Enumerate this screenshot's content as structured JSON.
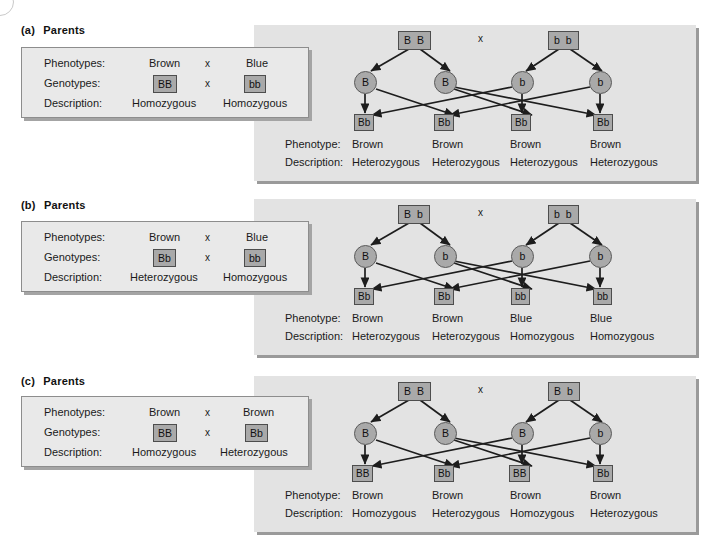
{
  "figure": {
    "colors": {
      "page_background": "#ffffff",
      "panel_background": "#e3e3e3",
      "parents_box_background": "#e9e9e9",
      "chip_fill": "#a9a9a9",
      "chip_border": "#4d4d4d",
      "shadow": "#9a9a9a",
      "text": "#1a1a1a"
    }
  },
  "labels": {
    "phenotypes_row": "Phenotypes:",
    "genotypes_row": "Genotypes:",
    "description_row": "Description:",
    "phenotype_row": "Phenotype:",
    "parents_heading": "Parents",
    "cross_symbol": "x"
  },
  "panels": [
    {
      "id": "a",
      "letter": "(a)",
      "heading": "Parents",
      "parents": {
        "phenotypes": [
          "Brown",
          "Blue"
        ],
        "genotypes": [
          "BB",
          "bb"
        ],
        "descriptions": [
          "Homozygous",
          "Homozygous"
        ],
        "cross_symbol": "x"
      },
      "diagram": {
        "parent_boxes": [
          "B B",
          "b b"
        ],
        "cross_symbol": "x",
        "gametes": [
          "B",
          "B",
          "b",
          "b"
        ],
        "offspring": [
          "Bb",
          "Bb",
          "Bb",
          "Bb"
        ],
        "phenotypes": [
          "Brown",
          "Brown",
          "Brown",
          "Brown"
        ],
        "descriptions": [
          "Heterozygous",
          "Heterozygous",
          "Heterozygous",
          "Heterozygous"
        ]
      }
    },
    {
      "id": "b",
      "letter": "(b)",
      "heading": "Parents",
      "parents": {
        "phenotypes": [
          "Brown",
          "Blue"
        ],
        "genotypes": [
          "Bb",
          "bb"
        ],
        "descriptions": [
          "Heterozygous",
          "Homozygous"
        ],
        "cross_symbol": "x"
      },
      "diagram": {
        "parent_boxes": [
          "B b",
          "b b"
        ],
        "cross_symbol": "x",
        "gametes": [
          "B",
          "b",
          "b",
          "b"
        ],
        "offspring": [
          "Bb",
          "Bb",
          "bb",
          "bb"
        ],
        "phenotypes": [
          "Brown",
          "Brown",
          "Blue",
          "Blue"
        ],
        "descriptions": [
          "Heterozygous",
          "Heterozygous",
          "Homozygous",
          "Homozygous"
        ]
      }
    },
    {
      "id": "c",
      "letter": "(c)",
      "heading": "Parents",
      "parents": {
        "phenotypes": [
          "Brown",
          "Brown"
        ],
        "genotypes": [
          "BB",
          "Bb"
        ],
        "descriptions": [
          "Homozygous",
          "Heterozygous"
        ],
        "cross_symbol": "x"
      },
      "diagram": {
        "parent_boxes": [
          "B B",
          "B b"
        ],
        "cross_symbol": "x",
        "gametes": [
          "B",
          "B",
          "B",
          "b"
        ],
        "offspring": [
          "BB",
          "Bb",
          "BB",
          "Bb"
        ],
        "phenotypes": [
          "Brown",
          "Brown",
          "Brown",
          "Brown"
        ],
        "descriptions": [
          "Homozygous",
          "Heterozygous",
          "Homozygous",
          "Heterozygous"
        ]
      }
    }
  ]
}
